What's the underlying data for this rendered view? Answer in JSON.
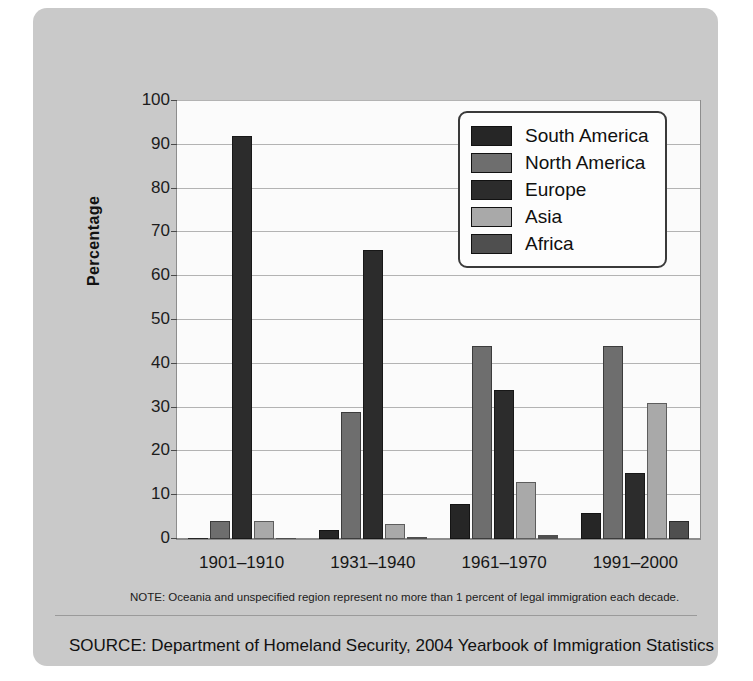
{
  "chart_data": {
    "type": "bar",
    "title": "",
    "xlabel": "",
    "ylabel": "Percentage",
    "ylim": [
      0,
      100
    ],
    "ytick_step": 10,
    "yticks": [
      0,
      10,
      20,
      30,
      40,
      50,
      60,
      70,
      80,
      90,
      100
    ],
    "grid": true,
    "legend_position": "top-right",
    "categories": [
      "1901–1910",
      "1931–1940",
      "1961–1970",
      "1991–2000"
    ],
    "series": [
      {
        "name": "South America",
        "color": "#262626",
        "values": [
          0.3,
          2,
          8,
          6
        ]
      },
      {
        "name": "North America",
        "color": "#6e6e6e",
        "values": [
          4,
          29,
          44,
          44
        ]
      },
      {
        "name": "Europe",
        "color": "#2c2c2c",
        "values": [
          92,
          66,
          34,
          15
        ]
      },
      {
        "name": "Asia",
        "color": "#a9a9a9",
        "values": [
          4,
          3.5,
          13,
          31
        ]
      },
      {
        "name": "Africa",
        "color": "#4f4f4f",
        "values": [
          0.2,
          0.4,
          1,
          4
        ]
      }
    ],
    "note": "NOTE: Oceania and unspecified region represent no more than 1 percent of legal immigration each decade.",
    "source": "SOURCE: Department of Homeland Security, 2004 Yearbook of Immigration Statistics"
  },
  "colors": {
    "panel_background": "#c9c9c9",
    "plot_background": "#fbfbfb",
    "gridline": "#b3b3b3",
    "axis": "#8d8d8d",
    "text": "#111111"
  }
}
